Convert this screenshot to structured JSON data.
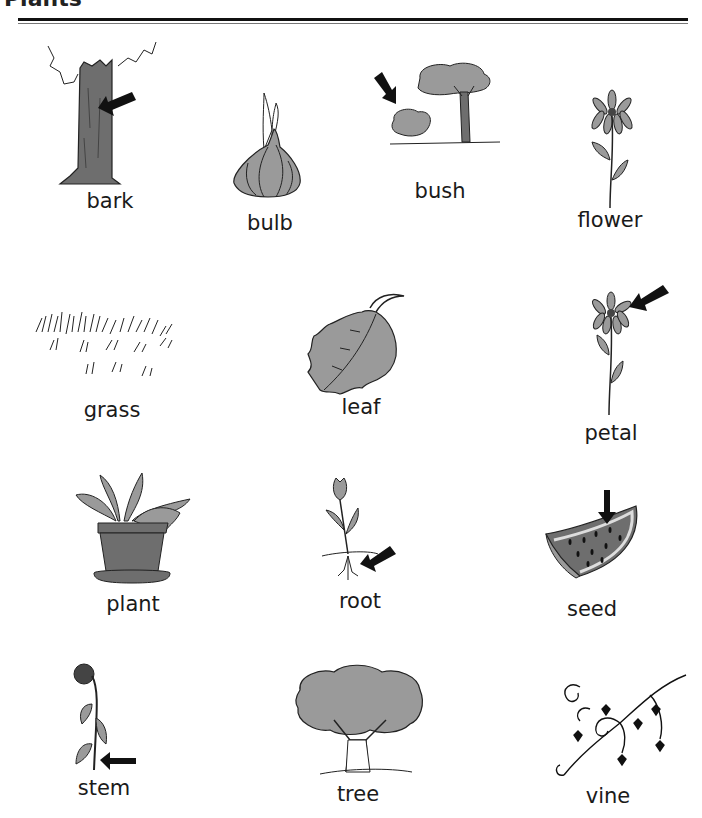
{
  "page": {
    "title": "Plants"
  },
  "items": [
    {
      "word": "bark"
    },
    {
      "word": "bulb"
    },
    {
      "word": "bush"
    },
    {
      "word": "flower"
    },
    {
      "word": "grass"
    },
    {
      "word": "leaf"
    },
    {
      "word": "petal"
    },
    {
      "word": "plant"
    },
    {
      "word": "root"
    },
    {
      "word": "seed"
    },
    {
      "word": "stem"
    },
    {
      "word": "tree"
    },
    {
      "word": "vine"
    }
  ],
  "colors": {
    "fill": "#9a9a9a",
    "dark_fill": "#6e6e6e",
    "ink": "#111111"
  }
}
